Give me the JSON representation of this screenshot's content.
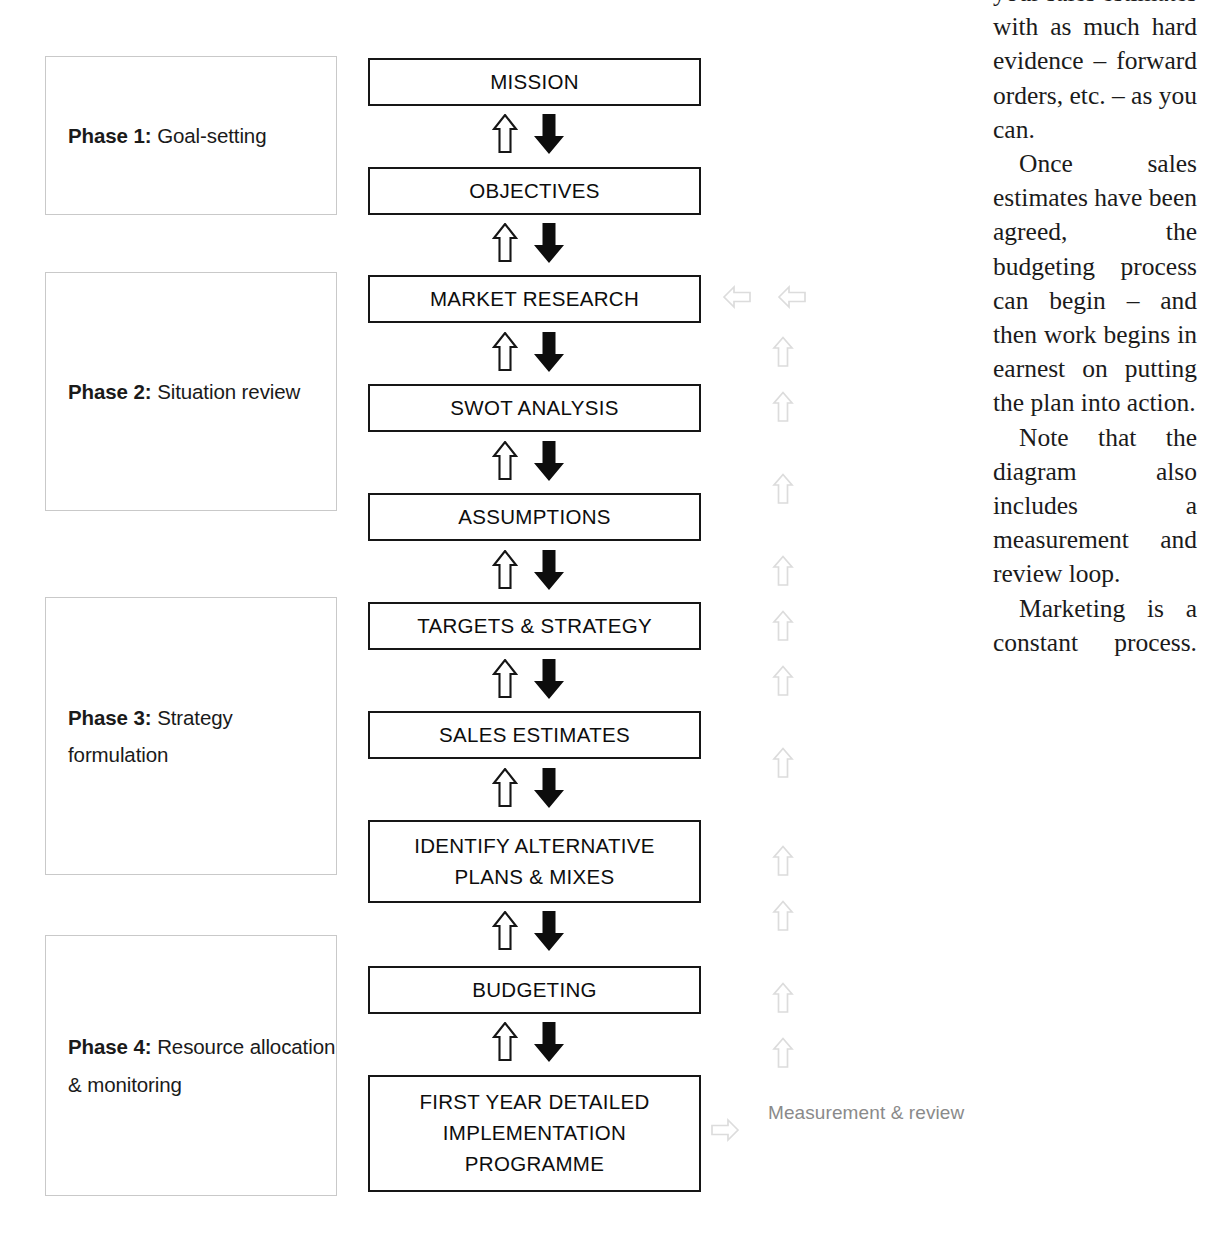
{
  "diagram": {
    "phases": [
      {
        "number": "Phase 1:",
        "name": " Goal-setting",
        "top": 56,
        "height": 159
      },
      {
        "number": "Phase 2:",
        "name": " Situation review",
        "top": 272,
        "height": 239
      },
      {
        "number": "Phase 3:",
        "name": " Strategy formulation",
        "top": 597,
        "height": 278
      },
      {
        "number": "Phase 4:",
        "name": " Resource allocation & monitoring",
        "top": 935,
        "height": 261
      }
    ],
    "steps": [
      {
        "label": "MISSION",
        "top": 58,
        "height": 48
      },
      {
        "label": "OBJECTIVES",
        "top": 167,
        "height": 48
      },
      {
        "label": "MARKET RESEARCH",
        "top": 275,
        "height": 48
      },
      {
        "label": "SWOT ANALYSIS",
        "top": 384,
        "height": 48
      },
      {
        "label": "ASSUMPTIONS",
        "top": 493,
        "height": 48
      },
      {
        "label": "TARGETS & STRATEGY",
        "top": 602,
        "height": 48
      },
      {
        "label": "SALES ESTIMATES",
        "top": 711,
        "height": 48
      },
      {
        "label": "IDENTIFY ALTERNATIVE\nPLANS & MIXES",
        "top": 820,
        "height": 83
      },
      {
        "label": "BUDGETING",
        "top": 966,
        "height": 48
      },
      {
        "label": "FIRST YEAR DETAILED\nIMPLEMENTATION\nPROGRAMME",
        "top": 1075,
        "height": 117
      }
    ],
    "connector_tops": [
      112,
      221,
      330,
      439,
      548,
      657,
      766,
      909,
      1020
    ],
    "feedback_loop": {
      "left_arrows": [
        {
          "left": 722,
          "top": 284
        },
        {
          "left": 777,
          "top": 284
        }
      ],
      "up_arrows_left": 772,
      "up_arrow_tops": [
        336,
        391,
        473,
        555,
        610,
        665,
        747,
        845,
        900,
        982,
        1037
      ],
      "return_arrow": {
        "left": 710,
        "top": 1115
      },
      "caption": "Measurement & review"
    },
    "colors": {
      "box_border": "#161616",
      "phase_border": "#c9c9c9",
      "gray_arrow": "#d8d8d8",
      "caption_text": "#8a8a8a",
      "text": "#0d0d0d"
    }
  },
  "body_text": {
    "paragraphs": [
      "your sales estimates with as much hard evidence – forward orders, etc. – as you can.",
      "Once sales estimates have been agreed, the budgeting process can begin – and then work begins in earnest on putting the plan into action.",
      "Note that the diagram also includes a measurement and review loop.",
      "Marketing is a constant process."
    ]
  }
}
